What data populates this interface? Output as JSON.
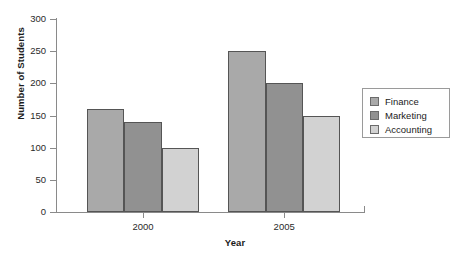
{
  "chart_data": {
    "type": "bar",
    "title": "",
    "xlabel": "Year",
    "ylabel": "Number of Students",
    "categories": [
      "2000",
      "2005"
    ],
    "series": [
      {
        "name": "Finance",
        "values": [
          160,
          250
        ],
        "color": "#a9a9a9"
      },
      {
        "name": "Marketing",
        "values": [
          140,
          200
        ],
        "color": "#919191"
      },
      {
        "name": "Accounting",
        "values": [
          100,
          150
        ],
        "color": "#d2d2d2"
      }
    ],
    "ylim": [
      0,
      300
    ],
    "yticks": [
      0,
      50,
      100,
      150,
      200,
      250,
      300
    ],
    "ytick_labels": [
      "0",
      "50",
      "100",
      "150",
      "200",
      "250",
      "300"
    ],
    "grid": false,
    "legend_position": "right",
    "legend_entries": [
      "Finance",
      "Marketing",
      "Accounting"
    ]
  },
  "axes": {
    "y_title": "Number of Students",
    "x_title": "Year"
  }
}
